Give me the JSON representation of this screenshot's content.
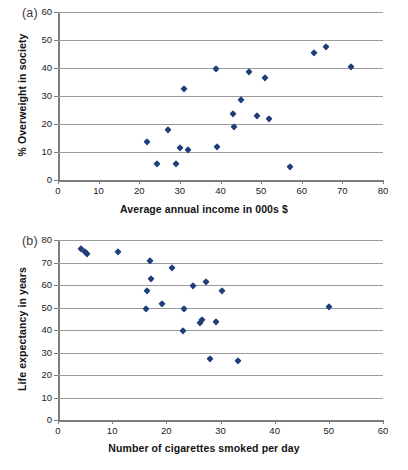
{
  "chart_data": [
    {
      "type": "scatter",
      "panel": "(a)",
      "title": "",
      "xlabel": "Average annual income in 000s $",
      "ylabel": "% Overweight in society",
      "xlim": [
        0,
        80
      ],
      "ylim": [
        0,
        60
      ],
      "xticks": [
        0,
        10,
        20,
        30,
        40,
        50,
        60,
        70,
        80
      ],
      "yticks": [
        0,
        10,
        20,
        30,
        40,
        50,
        60
      ],
      "grid": "horizontal",
      "legend": "none",
      "marker": "diamond",
      "color": "#1f3f7a",
      "points": [
        [
          22.0,
          13.7
        ],
        [
          24.3,
          5.7
        ],
        [
          27.0,
          17.7
        ],
        [
          29.0,
          5.7
        ],
        [
          30.0,
          11.6
        ],
        [
          31.0,
          32.6
        ],
        [
          32.0,
          10.6
        ],
        [
          39.0,
          39.5
        ],
        [
          39.2,
          11.7
        ],
        [
          43.0,
          23.7
        ],
        [
          43.2,
          18.8
        ],
        [
          45.0,
          28.7
        ],
        [
          47.0,
          38.5
        ],
        [
          49.0,
          22.7
        ],
        [
          51.0,
          36.6
        ],
        [
          52.0,
          21.7
        ],
        [
          57.0,
          4.8
        ],
        [
          63.0,
          45.5
        ],
        [
          66.0,
          47.6
        ],
        [
          72.0,
          40.4
        ]
      ]
    },
    {
      "type": "scatter",
      "panel": "(b)",
      "title": "",
      "xlabel": "Number of cigarettes smoked per day",
      "ylabel": "Life expectancy in years",
      "xlim": [
        0,
        60
      ],
      "ylim": [
        0,
        80
      ],
      "xticks": [
        0,
        10,
        20,
        30,
        40,
        50,
        60
      ],
      "yticks": [
        0,
        10,
        20,
        30,
        40,
        50,
        60,
        70,
        80
      ],
      "grid": "horizontal",
      "legend": "none",
      "marker": "diamond",
      "color": "#1f3f7a",
      "points": [
        [
          4.3,
          75.8
        ],
        [
          5.0,
          74.6
        ],
        [
          5.4,
          73.8
        ],
        [
          11.0,
          74.5
        ],
        [
          16.3,
          49.5
        ],
        [
          16.4,
          57.5
        ],
        [
          17.0,
          70.5
        ],
        [
          17.2,
          62.6
        ],
        [
          19.2,
          51.5
        ],
        [
          21.0,
          67.5
        ],
        [
          23.0,
          39.5
        ],
        [
          23.2,
          49.5
        ],
        [
          25.0,
          59.5
        ],
        [
          26.3,
          43.3
        ],
        [
          26.5,
          44.5
        ],
        [
          27.3,
          61.5
        ],
        [
          28.0,
          27.3
        ],
        [
          29.2,
          43.5
        ],
        [
          30.3,
          57.5
        ],
        [
          33.2,
          26.3
        ],
        [
          50.0,
          50.3
        ]
      ]
    }
  ],
  "panel_a": {
    "label": "(a)",
    "ylabel": "% Overweight in society",
    "xlabel": "Average annual income in 000s $"
  },
  "panel_b": {
    "label": "(b)",
    "ylabel": "Life expectancy in years",
    "xlabel": "Number of cigarettes smoked per day"
  }
}
